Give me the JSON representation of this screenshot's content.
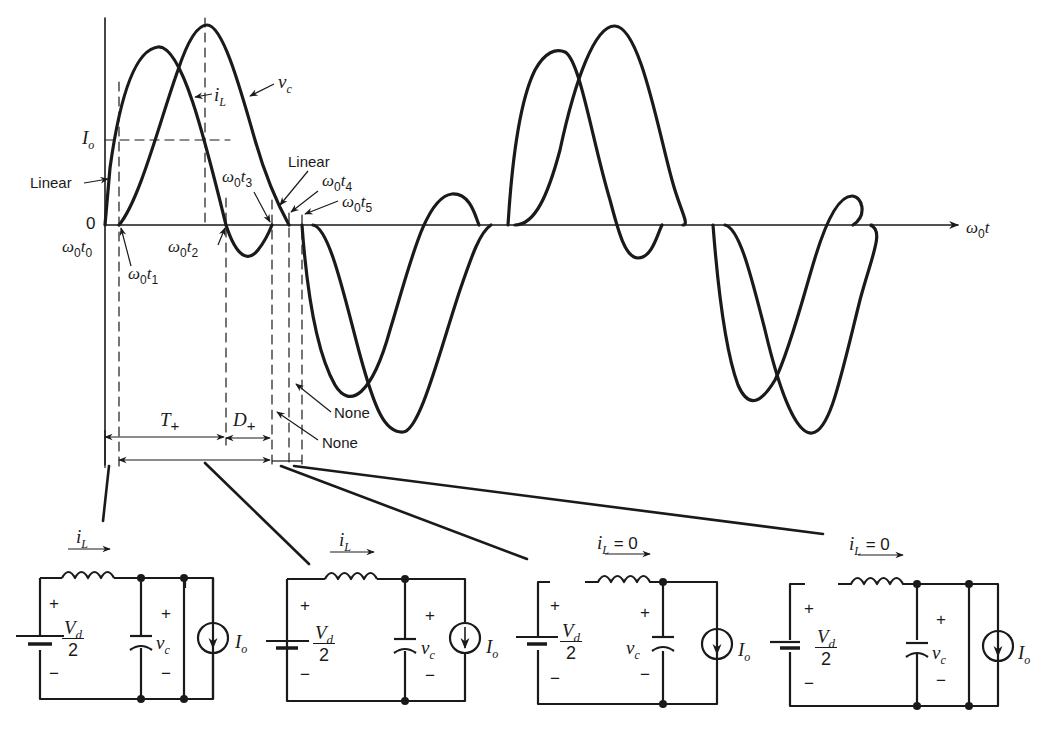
{
  "figure": {
    "axis": {
      "x_label_main": "ω",
      "x_label_sub": "0",
      "x_label_var": "t",
      "zero_label": "0",
      "Io_label_main": "I",
      "Io_label_sub": "o"
    },
    "waveform_labels": {
      "iL_main": "i",
      "iL_sub": "L",
      "vc_main": "v",
      "vc_sub": "c",
      "linear_1": "Linear",
      "linear_2": "Linear"
    },
    "time_markers": [
      {
        "main": "ω",
        "sub": "0",
        "var": "t",
        "idx": "0"
      },
      {
        "main": "ω",
        "sub": "0",
        "var": "t",
        "idx": "1"
      },
      {
        "main": "ω",
        "sub": "0",
        "var": "t",
        "idx": "2"
      },
      {
        "main": "ω",
        "sub": "0",
        "var": "t",
        "idx": "3"
      },
      {
        "main": "ω",
        "sub": "0",
        "var": "t",
        "idx": "4"
      },
      {
        "main": "ω",
        "sub": "0",
        "var": "t",
        "idx": "5"
      }
    ],
    "intervals": {
      "T_main": "T",
      "T_sub": "+",
      "D_main": "D",
      "D_sub": "+",
      "none_1": "None",
      "none_2": "None"
    },
    "circuits": [
      {
        "current_main": "i",
        "current_sub": "L",
        "current_suffix": "",
        "plus": "+",
        "minus": "−",
        "vd_num": "V",
        "vd_num_sub": "d",
        "vd_den": "2",
        "vc_main": "v",
        "vc_sub": "c",
        "io_main": "I",
        "io_sub": "o"
      },
      {
        "current_main": "i",
        "current_sub": "L",
        "current_suffix": "",
        "plus": "+",
        "minus": "−",
        "vd_num": "V",
        "vd_num_sub": "d",
        "vd_den": "2",
        "vc_main": "v",
        "vc_sub": "c",
        "io_main": "I",
        "io_sub": "o"
      },
      {
        "current_main": "i",
        "current_sub": "L",
        "current_suffix": " = 0",
        "plus": "+",
        "minus": "−",
        "vd_num": "V",
        "vd_num_sub": "d",
        "vd_den": "2",
        "vc_main": "v",
        "vc_sub": "c",
        "io_main": "I",
        "io_sub": "o"
      },
      {
        "current_main": "i",
        "current_sub": "L",
        "current_suffix": " = 0",
        "plus": "+",
        "minus": "−",
        "vd_num": "V",
        "vd_num_sub": "d",
        "vd_den": "2",
        "vc_main": "v",
        "vc_sub": "c",
        "io_main": "I",
        "io_sub": "o"
      }
    ],
    "colors": {
      "ink": "#1a1a1a",
      "background": "#ffffff"
    }
  }
}
